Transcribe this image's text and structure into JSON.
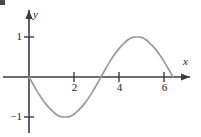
{
  "figure": {
    "name": "sine-curve-graph",
    "background_color": "#ffffff",
    "axis_color": "#3b3b3b",
    "curve_color": "#9a9a9a",
    "label_color": "#1a1a1a"
  },
  "axes": {
    "x": {
      "label": "x",
      "tick_labels": [
        "2",
        "4",
        "6"
      ],
      "tick_values": [
        2,
        4,
        6
      ],
      "range": [
        -0.3,
        7.2
      ],
      "arrow": true
    },
    "y": {
      "label": "y",
      "tick_labels": [
        "1",
        "−1"
      ],
      "tick_values": [
        1,
        -1
      ],
      "range": [
        -1.5,
        1.5
      ],
      "arrow": true
    }
  },
  "chart_data": {
    "type": "line",
    "title": "",
    "xlabel": "x",
    "ylabel": "y",
    "grid": false,
    "legend": "none",
    "xlim": [
      -0.3,
      7.2
    ],
    "ylim": [
      -1.5,
      1.5
    ],
    "xticks": [
      2,
      4,
      6
    ],
    "xtick_labels": [
      "2",
      "4",
      "6"
    ],
    "yticks": [
      1,
      -1
    ],
    "ytick_labels": [
      "1",
      "−1"
    ],
    "series": [
      {
        "name": "y = sin(x)",
        "x": [
          0.0,
          0.2,
          0.4,
          0.6,
          0.8,
          1.0,
          1.2,
          1.4,
          1.6,
          1.8,
          2.0,
          2.2,
          2.4,
          2.6,
          2.8,
          3.0,
          3.2,
          3.4,
          3.6,
          3.8,
          4.0,
          4.2,
          4.4,
          4.6,
          4.8,
          5.0,
          5.2,
          5.4,
          5.6,
          5.8,
          6.0,
          6.2,
          6.4
        ],
        "y": [
          0.0,
          -0.2,
          -0.39,
          -0.56,
          -0.71,
          -0.83,
          -0.93,
          -0.99,
          -1.0,
          -0.99,
          -0.93,
          -0.83,
          -0.71,
          -0.56,
          -0.39,
          -0.2,
          0.0,
          0.2,
          0.39,
          0.56,
          0.71,
          0.83,
          0.93,
          0.99,
          1.0,
          0.99,
          0.93,
          0.83,
          0.71,
          0.56,
          0.39,
          0.2,
          0.0
        ]
      }
    ],
    "annotations": {
      "x_intercepts": [
        0.0,
        3.2,
        6.4
      ],
      "minimum": {
        "x": 1.6,
        "y": -1.0
      },
      "maximum": {
        "x": 4.8,
        "y": 1.0
      }
    }
  }
}
